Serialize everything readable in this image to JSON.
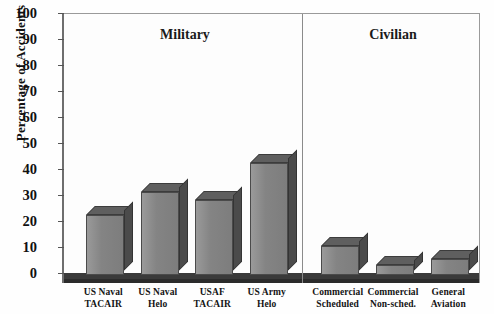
{
  "chart_data": {
    "type": "bar",
    "title": "",
    "xlabel": "",
    "ylabel": "Percentage of Accidents",
    "ylim": [
      0,
      100
    ],
    "yticks": [
      0,
      10,
      20,
      30,
      40,
      50,
      60,
      70,
      80,
      90,
      100
    ],
    "grid": false,
    "legend": null,
    "style": "3d-bar",
    "categories": [
      "US Naval TACAIR",
      "US Naval Helo",
      "USAF TACAIR",
      "US Army Helo",
      "Commercial Scheduled",
      "Commercial Non-sched.",
      "General Aviation"
    ],
    "values": [
      23,
      32,
      29,
      43,
      11,
      4,
      6
    ],
    "annotations": [
      "Military",
      "Civilian"
    ],
    "groups": [
      {
        "name": "Military",
        "categories": [
          "US Naval TACAIR",
          "US Naval Helo",
          "USAF TACAIR",
          "US Army Helo"
        ]
      },
      {
        "name": "Civilian",
        "categories": [
          "Commercial Scheduled",
          "Commercial Non-sched.",
          "General Aviation"
        ]
      }
    ],
    "colors": {
      "bar_front": "#878787",
      "bar_top": "#5f5f5f",
      "bar_side": "#4b4b4b",
      "axis": "#555555",
      "plot_background": "#fdfdfd"
    }
  },
  "axis": {
    "y_title": "Percentage of Accidents",
    "y_tick_labels": [
      "100",
      "90",
      "80",
      "70",
      "60",
      "50",
      "40",
      "30",
      "20",
      "10",
      "0"
    ]
  },
  "sections": [
    {
      "label": "Military"
    },
    {
      "label": "Civilian"
    }
  ],
  "x_categories": [
    {
      "line1": "US Naval",
      "line2": "TACAIR",
      "value": 23
    },
    {
      "line1": "US Naval",
      "line2": "Helo",
      "value": 32
    },
    {
      "line1": "USAF",
      "line2": "TACAIR",
      "value": 29
    },
    {
      "line1": "US Army",
      "line2": "Helo",
      "value": 43
    },
    {
      "line1": "Commercial",
      "line2": "Scheduled",
      "value": 11
    },
    {
      "line1": "Commercial",
      "line2": "Non-sched.",
      "value": 4
    },
    {
      "line1": "General",
      "line2": "Aviation",
      "value": 6
    }
  ]
}
